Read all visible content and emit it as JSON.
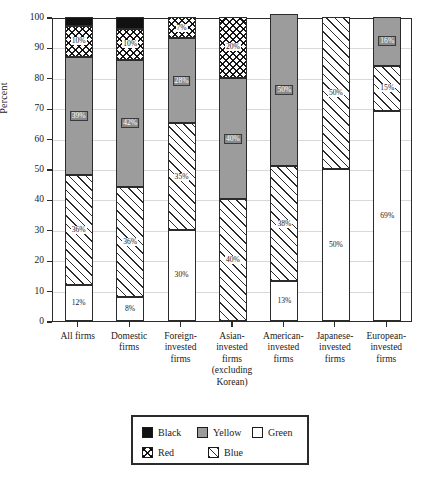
{
  "chart_data": {
    "type": "bar",
    "subtype": "stacked-100-percent",
    "title": "",
    "xlabel": "",
    "ylabel": "Percent",
    "ylim": [
      0,
      100
    ],
    "yticks": [
      0,
      10,
      20,
      30,
      40,
      50,
      60,
      70,
      80,
      90,
      100
    ],
    "grid": true,
    "legend_position": "bottom",
    "stack_order_bottom_to_top": [
      "Green",
      "Blue",
      "Yellow",
      "Red",
      "Black"
    ],
    "categories": [
      "All firms",
      "Domestic firms",
      "Foreign-invested firms",
      "Asian-invested firms (excluding Korean)",
      "American-invested firms",
      "Japanese-invested firms",
      "European-invested firms"
    ],
    "category_lines": [
      [
        "All firms"
      ],
      [
        "Domestic",
        "firms"
      ],
      [
        "Foreign-",
        "invested",
        "firms"
      ],
      [
        "Asian-",
        "invested",
        "firms",
        "(excluding",
        "Korean)"
      ],
      [
        "American-",
        "invested",
        "firms"
      ],
      [
        "Japanese-",
        "invested",
        "firms"
      ],
      [
        "European-",
        "invested",
        "firms"
      ]
    ],
    "series": [
      {
        "name": "Green",
        "fill": "white",
        "color": "#ffffff",
        "values": [
          12,
          8,
          30,
          0,
          13,
          50,
          69
        ]
      },
      {
        "name": "Blue",
        "fill": "diagonal-hatch",
        "color": "#ffffff",
        "values": [
          36,
          36,
          35,
          40,
          38,
          50,
          15
        ]
      },
      {
        "name": "Yellow",
        "fill": "gray",
        "color": "#9c9c9c",
        "values": [
          39,
          42,
          28,
          40,
          50,
          0,
          16
        ]
      },
      {
        "name": "Red",
        "fill": "zigzag-hatch",
        "color": "#ffffff",
        "values": [
          10,
          10,
          7,
          20,
          0,
          0,
          0
        ]
      },
      {
        "name": "Black",
        "fill": "solid-black",
        "color": "#111111",
        "values": [
          3,
          4,
          0,
          0,
          0,
          0,
          0
        ]
      }
    ],
    "data_labels": {
      "All firms": {
        "Green": "12%",
        "Blue": "36%",
        "Yellow": "39%",
        "Red": "10%",
        "Black": ""
      },
      "Domestic firms": {
        "Green": "8%",
        "Blue": "36%",
        "Yellow": "42%",
        "Red": "10%",
        "Black": ""
      },
      "Foreign-invested firms": {
        "Green": "30%",
        "Blue": "35%",
        "Yellow": "28%",
        "Red": "7%",
        "Black": ""
      },
      "Asian-invested firms (excluding Korean)": {
        "Green": "",
        "Blue": "40%",
        "Yellow": "40%",
        "Red": "20%",
        "Black": ""
      },
      "American-invested firms": {
        "Green": "13%",
        "Blue": "38%",
        "Yellow": "50%",
        "Red": "",
        "Black": ""
      },
      "Japanese-invested firms": {
        "Green": "50%",
        "Blue": "50%",
        "Yellow": "",
        "Red": "",
        "Black": ""
      },
      "European-invested firms": {
        "Green": "69%",
        "Blue": "15%",
        "Yellow": "16%",
        "Red": "",
        "Black": ""
      }
    }
  },
  "legend": {
    "rows": [
      [
        {
          "name": "Black",
          "swatch": "solid-black"
        },
        {
          "name": "Yellow",
          "swatch": "gray"
        },
        {
          "name": "Green",
          "swatch": "white"
        }
      ],
      [
        {
          "name": "Red",
          "swatch": "zigzag-hatch"
        },
        {
          "name": "Blue",
          "swatch": "diagonal-hatch"
        }
      ]
    ]
  }
}
